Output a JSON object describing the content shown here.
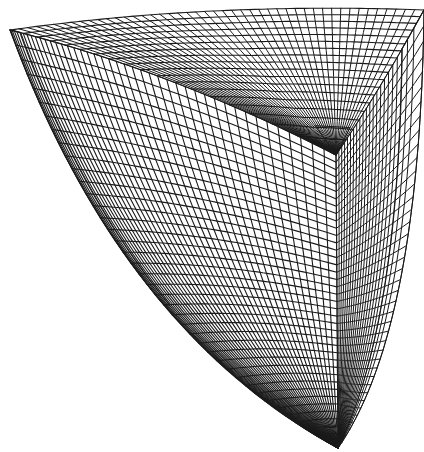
{
  "figure": {
    "background": "#ffffff",
    "line_color": "#1a1a1a"
  },
  "geometry": {
    "vertex_top_left": [
      10,
      30
    ],
    "vertex_top_right": [
      424,
      10
    ],
    "vertex_inner_corner": [
      336,
      155
    ],
    "vertex_bottom_tip": [
      338,
      448
    ],
    "vertex_right_bottom": [
      396,
      250
    ]
  },
  "mesh": {
    "top_face": {
      "radial_lines": 46,
      "arc_lines": 18
    },
    "front_face": {
      "vertical_lines": 44,
      "horizontal_lines": 40
    },
    "right_face": {
      "vertical_lines": 22,
      "horizontal_lines": 40
    }
  }
}
